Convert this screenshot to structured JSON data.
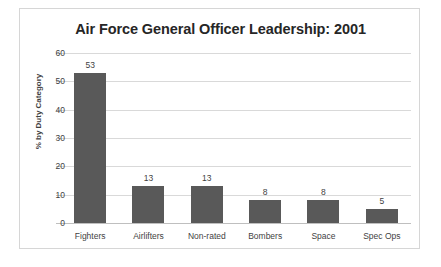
{
  "chart_data": {
    "type": "bar",
    "title": "Air Force General Officer Leadership: 2001",
    "xlabel": "",
    "ylabel": "% by Duty Category",
    "categories": [
      "Fighters",
      "Airlifters",
      "Non-rated",
      "Bombers",
      "Space",
      "Spec Ops"
    ],
    "values": [
      53,
      13,
      13,
      8,
      8,
      5
    ],
    "value_labels": [
      "53",
      "13",
      "13",
      "8",
      "8",
      "5"
    ],
    "ylim": [
      0,
      60
    ],
    "yticks": [
      0,
      10,
      20,
      30,
      40,
      50,
      60
    ],
    "ytick_labels": [
      "0",
      "10",
      "20",
      "30",
      "40",
      "50",
      "60"
    ],
    "grid": "horizontal",
    "legend": "none",
    "bar_color": "#595959",
    "gridline_color": "#d9d9d9",
    "text_color": "#3f3f3f",
    "title_color": "#262626",
    "frame_color": "#d6d6d6",
    "background": "#ffffff"
  }
}
